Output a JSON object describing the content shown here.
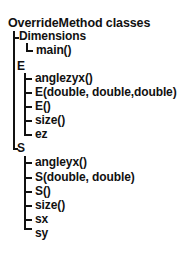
{
  "tree": {
    "title": "OverrideMethod classes",
    "classes": [
      {
        "name": "Dimensions",
        "members": [
          "main()"
        ]
      },
      {
        "name": "E",
        "members": [
          "anglezyx()",
          "E(double, double,double)",
          "E()",
          "size()",
          "ez"
        ]
      },
      {
        "name": "S",
        "members": [
          "angleyx()",
          "S(double, double)",
          "S()",
          "size()",
          "sx",
          "sy"
        ]
      }
    ]
  }
}
